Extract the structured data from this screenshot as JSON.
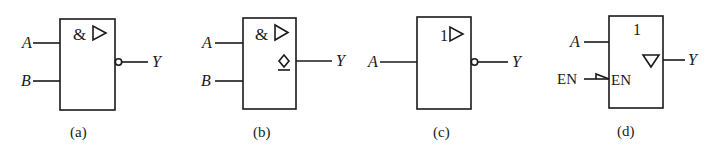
{
  "figure": {
    "gates": [
      {
        "id": "a",
        "caption": "(a)",
        "symbol": "&",
        "qualifier": "buffer-triangle",
        "inputs": [
          "A",
          "B"
        ],
        "output": "Y",
        "output_modifier": "inversion-bubble",
        "description": "NAND gate (IEC)"
      },
      {
        "id": "b",
        "caption": "(b)",
        "symbol": "&",
        "qualifier": "buffer-triangle",
        "inputs": [
          "A",
          "B"
        ],
        "output": "Y",
        "output_modifier": "open-collector-diamond",
        "description": "Open-collector NAND (OC gate)"
      },
      {
        "id": "c",
        "caption": "(c)",
        "symbol": "1",
        "qualifier": "buffer-triangle",
        "inputs": [
          "A"
        ],
        "output": "Y",
        "output_modifier": "inversion-bubble",
        "description": "Inverter (NOT gate)"
      },
      {
        "id": "d",
        "caption": "(d)",
        "symbol": "1",
        "qualifier": "tri-state-triangle",
        "inputs": [
          "A",
          "EN"
        ],
        "enable_label_inside": "EN",
        "output": "Y",
        "output_modifier": "none",
        "description": "Tri-state buffer with enable"
      }
    ]
  }
}
